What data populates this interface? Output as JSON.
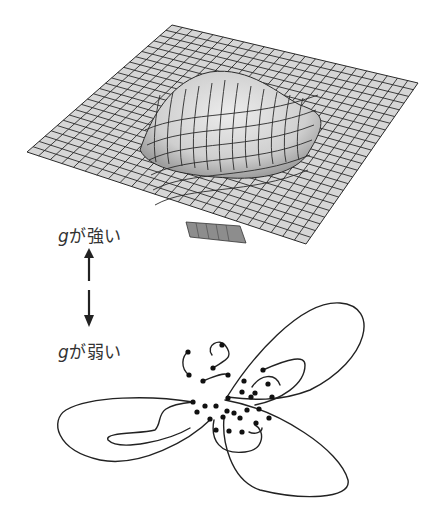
{
  "labels": {
    "strong": {
      "var": "g",
      "text": "が強い"
    },
    "weak": {
      "var": "g",
      "text": "が弱い"
    }
  },
  "colors": {
    "surface_fill": "#d4d4d4",
    "surface_shade": "#a9a9a9",
    "grid_line": "#2a2a2a",
    "curve": "#222222",
    "text": "#333333"
  },
  "arrow": {
    "direction": "bidirectional-vertical"
  },
  "bottom_diagram": {
    "dot_count": 30
  }
}
